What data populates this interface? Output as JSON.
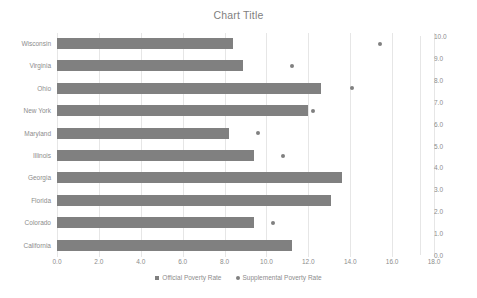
{
  "chart_data": {
    "type": "bar",
    "orientation": "horizontal",
    "title": "Chart Title",
    "xlabel": "",
    "ylabel": "",
    "categories": [
      "Wisconsin",
      "Virginia",
      "Ohio",
      "New York",
      "Maryland",
      "Illinois",
      "Georgia",
      "Florida",
      "Colorado",
      "California"
    ],
    "series": [
      {
        "name": "Official Poverty Rate",
        "type": "bar",
        "marker": "square",
        "color": "#808080",
        "axis": "primary",
        "values": [
          8.4,
          8.9,
          12.6,
          12.0,
          8.2,
          9.4,
          13.6,
          13.1,
          9.4,
          11.2
        ]
      },
      {
        "name": "Supplemental Poverty Rate",
        "type": "scatter",
        "marker": "dot",
        "color": "#808080",
        "axis": "secondary",
        "values": [
          15.4,
          11.2,
          14.1,
          12.2,
          9.6,
          10.8,
          null,
          null,
          10.3,
          null
        ]
      }
    ],
    "xlim": [
      0.0,
      18.0
    ],
    "xticks": [
      "0.0",
      "2.0",
      "4.0",
      "6.0",
      "8.0",
      "10.0",
      "12.0",
      "14.0",
      "16.0",
      "18.0"
    ],
    "secondary_ylim": [
      0.0,
      10.0
    ],
    "secondary_yticks": [
      "0.0",
      "1.0",
      "2.0",
      "3.0",
      "4.0",
      "5.0",
      "6.0",
      "7.0",
      "8.0",
      "9.0",
      "10.0"
    ],
    "grid": "vertical",
    "legend_position": "bottom"
  }
}
